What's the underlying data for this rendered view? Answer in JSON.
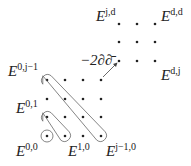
{
  "diagram": {
    "labels": {
      "e_jd": {
        "base": "E",
        "sup": "j,d"
      },
      "e_dd": {
        "base": "E",
        "sup": "d,d"
      },
      "e_dj": {
        "base": "E",
        "sup": "d,j"
      },
      "e_0j1": {
        "base": "E",
        "sup": "0,j−1"
      },
      "e_01": {
        "base": "E",
        "sup": "0,1"
      },
      "e_00": {
        "base": "E",
        "sup": "0,0"
      },
      "e_10": {
        "base": "E",
        "sup": "1,0"
      },
      "e_j10": {
        "base": "E",
        "sup": "j−1,0"
      },
      "operator": "−2∂∂̄"
    },
    "lower_grid": {
      "cols": [
        47,
        65,
        83,
        101
      ],
      "rows": [
        80,
        99,
        117,
        136
      ]
    },
    "upper_grid": {
      "cols": [
        119,
        137,
        155
      ],
      "rows": [
        24,
        42,
        61
      ]
    },
    "colors": {
      "ink": "#222222",
      "background": "#ffffff"
    }
  }
}
